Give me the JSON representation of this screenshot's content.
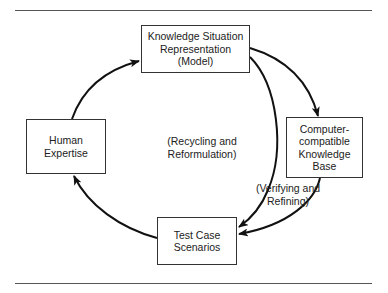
{
  "diagram": {
    "nodes": {
      "model": {
        "label": "Knowledge Situation\nRepresentation\n(Model)"
      },
      "kb": {
        "label": "Computer-\ncompatible\nKnowledge\nBase"
      },
      "tests": {
        "label": "Test Case\nScenarios"
      },
      "human": {
        "label": "Human\nExpertise"
      }
    },
    "annotations": {
      "center": "(Recycling and\nReformulation)",
      "verify": "(Verifying and\nRefining)"
    },
    "edges": [
      {
        "from": "model",
        "to": "kb"
      },
      {
        "from": "model",
        "to": "tests"
      },
      {
        "from": "kb",
        "to": "tests"
      },
      {
        "from": "tests",
        "to": "human"
      },
      {
        "from": "human",
        "to": "model"
      }
    ],
    "colors": {
      "stroke": "#111111",
      "rule": "#555555"
    }
  }
}
